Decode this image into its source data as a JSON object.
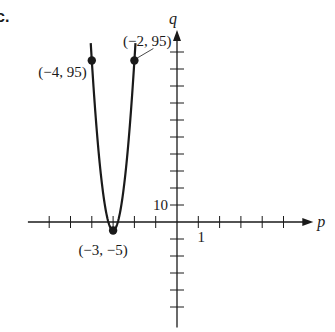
{
  "part_label": "c.",
  "chart_data": {
    "type": "line",
    "title": "",
    "xlabel": "p",
    "ylabel": "q",
    "function": "q = 100(p + 3)^2 - 5",
    "xlim": [
      -7,
      6.4
    ],
    "ylim": [
      -62,
      113
    ],
    "x_tick_step": 1,
    "y_tick_step": 10,
    "x_ticks": [
      -6,
      -5,
      -4,
      -3,
      -2,
      -1,
      1,
      2,
      3,
      4,
      5
    ],
    "y_ticks": [
      -50,
      -40,
      -30,
      -20,
      -10,
      10,
      20,
      30,
      40,
      50,
      60,
      70,
      80,
      90,
      100
    ],
    "tick_labels": [
      {
        "axis": "x",
        "value": 1,
        "text": "1"
      },
      {
        "axis": "y",
        "value": 10,
        "text": "10"
      }
    ],
    "series": [
      {
        "name": "parabola",
        "domain": [
          -4.05,
          -1.95
        ],
        "vertex": [
          -3,
          -5
        ],
        "color": "#1a1a1a"
      }
    ],
    "points": [
      {
        "x": -4,
        "y": 95,
        "label": "(−4, 95)",
        "label_side": "left"
      },
      {
        "x": -2,
        "y": 95,
        "label": "(−2, 95)",
        "label_side": "top-left"
      },
      {
        "x": -3,
        "y": -5,
        "label": "(−3, −5)",
        "label_side": "bottom-left"
      }
    ],
    "grid": false,
    "legend": "none"
  }
}
